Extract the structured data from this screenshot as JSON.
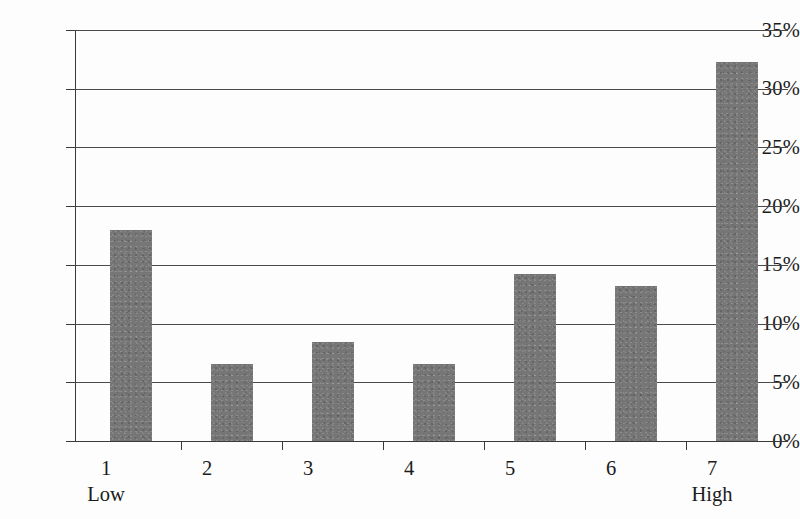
{
  "chart_data": {
    "type": "bar",
    "title": "",
    "subtitle": "",
    "xlabel": "",
    "ylabel": "",
    "categories": [
      "1",
      "2",
      "3",
      "4",
      "5",
      "6",
      "7"
    ],
    "category_endpoint_labels": {
      "first": "Low",
      "last": "High"
    },
    "values": [
      18.0,
      6.6,
      8.4,
      6.6,
      14.2,
      13.2,
      32.3
    ],
    "value_suffix": "%",
    "ylim": [
      0,
      35
    ],
    "ytick_step": 5,
    "ytick_labels": [
      "0%",
      "5%",
      "10%",
      "15%",
      "20%",
      "25%",
      "30%",
      "35%"
    ],
    "ytick_values": [
      0,
      5,
      10,
      15,
      20,
      25,
      30,
      35
    ],
    "grid": true,
    "grid_axis": "y",
    "legend": false,
    "legend_position": "none",
    "bar_color": "#767676",
    "axis_color": "#3a3a3a",
    "grid_color": "#4a4a4a",
    "background_color": "#fdfdfd",
    "annotations": []
  },
  "axis": {
    "x_labels": [
      {
        "num": "1",
        "sub": "Low"
      },
      {
        "num": "2",
        "sub": ""
      },
      {
        "num": "3",
        "sub": ""
      },
      {
        "num": "4",
        "sub": ""
      },
      {
        "num": "5",
        "sub": ""
      },
      {
        "num": "6",
        "sub": ""
      },
      {
        "num": "7",
        "sub": "High"
      }
    ]
  }
}
